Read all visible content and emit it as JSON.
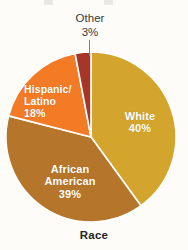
{
  "chart_data": {
    "type": "pie",
    "title": "Race",
    "xlabel": "Race",
    "ylabel": "",
    "legend_position": "none",
    "grid": false,
    "units": "percent",
    "start_angle_deg": 0,
    "direction": "clockwise",
    "categories": [
      "White",
      "African American",
      "Hispanic/Latino",
      "Other"
    ],
    "values": [
      40,
      39,
      18,
      3
    ],
    "slices": [
      {
        "name": "White",
        "label": "White",
        "value": 40,
        "value_label": "40%",
        "color": "#d4a52c",
        "label_placement": "inside",
        "label_color": "#ffffff"
      },
      {
        "name": "African American",
        "label_line1": "African",
        "label_line2": "American",
        "value": 39,
        "value_label": "39%",
        "color": "#b5752a",
        "label_placement": "inside",
        "label_color": "#ffffff"
      },
      {
        "name": "Hispanic/Latino",
        "label_line1": "Hispanic/",
        "label_line2": "Latino",
        "value": 18,
        "value_label": "18%",
        "color": "#f47b26",
        "label_placement": "inside",
        "label_color": "#ffffff"
      },
      {
        "name": "Other",
        "label": "Other",
        "value": 3,
        "value_label": "3%",
        "color": "#a8352a",
        "label_placement": "outside-leader",
        "label_color": "#3a3a38"
      }
    ]
  },
  "figure": {
    "background_color": "#fdfcf8",
    "slice_separator_color": "#ffffff",
    "axis_title": "Race",
    "center_x": 91,
    "center_y": 137,
    "radius": 85
  },
  "labels": {
    "white": {
      "name": "White",
      "pct": "40%"
    },
    "african_american": {
      "line1": "African",
      "line2": "American",
      "pct": "39%"
    },
    "hispanic_latino": {
      "line1": "Hispanic/",
      "line2": "Latino",
      "pct": "18%"
    },
    "other": {
      "name": "Other",
      "pct": "3%"
    }
  }
}
